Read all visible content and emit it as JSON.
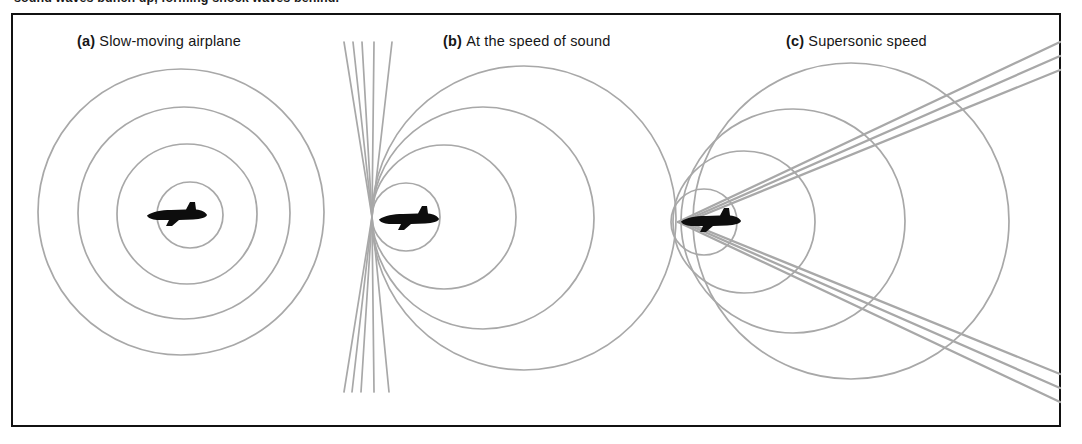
{
  "figure": {
    "top_caption": "sound waves bunch up, forming shock waves behind.",
    "frame_color": "#111111",
    "background_color": "#ffffff",
    "wave_color": "#a8a8a8",
    "airplane_color": "#0d0d0d"
  },
  "panels": [
    {
      "id": "a",
      "tag": "(a)",
      "label": "Slow-moving airplane",
      "label_full": "(a) Slow-moving airplane",
      "airplane": {
        "cx": 176,
        "cy": 215,
        "length": 62,
        "heading": "right"
      }
    },
    {
      "id": "b",
      "tag": "(b)",
      "label": "At the speed of sound",
      "label_full": "(b) At the speed of sound",
      "airplane": {
        "cx": 408,
        "cy": 219,
        "length": 62,
        "heading": "right"
      }
    },
    {
      "id": "c",
      "tag": "(c)",
      "label": "Supersonic speed",
      "label_full": "(c) Supersonic speed",
      "airplane": {
        "cx": 710,
        "cy": 221,
        "length": 62,
        "heading": "right"
      }
    }
  ],
  "chart_data": {
    "type": "diagram",
    "wave_color": "#a8a8a8",
    "wave_stroke_width": 1.7,
    "panel_a": {
      "description": "Subsonic: four concentric expanding circles, centers drift slightly right because source moves slowly",
      "mach_number": "< 1",
      "circles": [
        {
          "cx": 190,
          "cy": 215,
          "r": 33
        },
        {
          "cx": 187,
          "cy": 214,
          "r": 70
        },
        {
          "cx": 184,
          "cy": 213,
          "r": 106
        },
        {
          "cx": 181,
          "cy": 212,
          "r": 143
        }
      ],
      "cone_lines": []
    },
    "panel_b": {
      "description": "Mach 1: all wave fronts are tangent at the nose of the airplane, piling up into a vertical wall of sound",
      "mach_number": "= 1",
      "tangent_point": {
        "x": 372,
        "y": 217
      },
      "circles": [
        {
          "cx": 406,
          "cy": 217,
          "r": 34
        },
        {
          "cx": 444,
          "cy": 217,
          "r": 72
        },
        {
          "cx": 483,
          "cy": 218,
          "r": 111
        },
        {
          "cx": 524,
          "cy": 218,
          "r": 152
        }
      ],
      "cone_lines": [
        {
          "x1": 372,
          "y1": 217,
          "x2": 344,
          "y2": 42,
          "x3": 344,
          "y3": 392
        },
        {
          "x1": 372,
          "y1": 217,
          "x2": 353,
          "y2": 42,
          "x3": 352,
          "y3": 392
        },
        {
          "x1": 372,
          "y1": 217,
          "x2": 362,
          "y2": 42,
          "x3": 361,
          "y3": 392
        },
        {
          "x1": 372,
          "y1": 217,
          "x2": 374,
          "y2": 42,
          "x3": 374,
          "y3": 392
        },
        {
          "x1": 372,
          "y1": 217,
          "x2": 392,
          "y2": 42,
          "x3": 389,
          "y3": 392
        }
      ]
    },
    "panel_c": {
      "description": "Supersonic: circles fall behind the airplane and their common tangents form a V-shaped Mach cone (shock wave)",
      "mach_number": "> 1",
      "apex": {
        "x": 678,
        "y": 222
      },
      "circles": [
        {
          "cx": 704,
          "cy": 222,
          "r": 33
        },
        {
          "cx": 744,
          "cy": 222,
          "r": 71
        },
        {
          "cx": 793,
          "cy": 221,
          "r": 112
        },
        {
          "cx": 851,
          "cy": 221,
          "r": 158
        }
      ],
      "cone_half_angle_deg": 26,
      "cone_lines": [
        {
          "apex_x": 678,
          "apex_y": 222,
          "dx": 382,
          "dy": -180
        },
        {
          "apex_x": 682,
          "apex_y": 222,
          "dx": 378,
          "dy": -166
        },
        {
          "apex_x": 686,
          "apex_y": 222,
          "dx": 374,
          "dy": -152
        },
        {
          "apex_x": 678,
          "apex_y": 222,
          "dx": 382,
          "dy": 180
        },
        {
          "apex_x": 682,
          "apex_y": 222,
          "dx": 378,
          "dy": 166
        },
        {
          "apex_x": 686,
          "apex_y": 222,
          "dx": 374,
          "dy": 152
        }
      ]
    }
  }
}
